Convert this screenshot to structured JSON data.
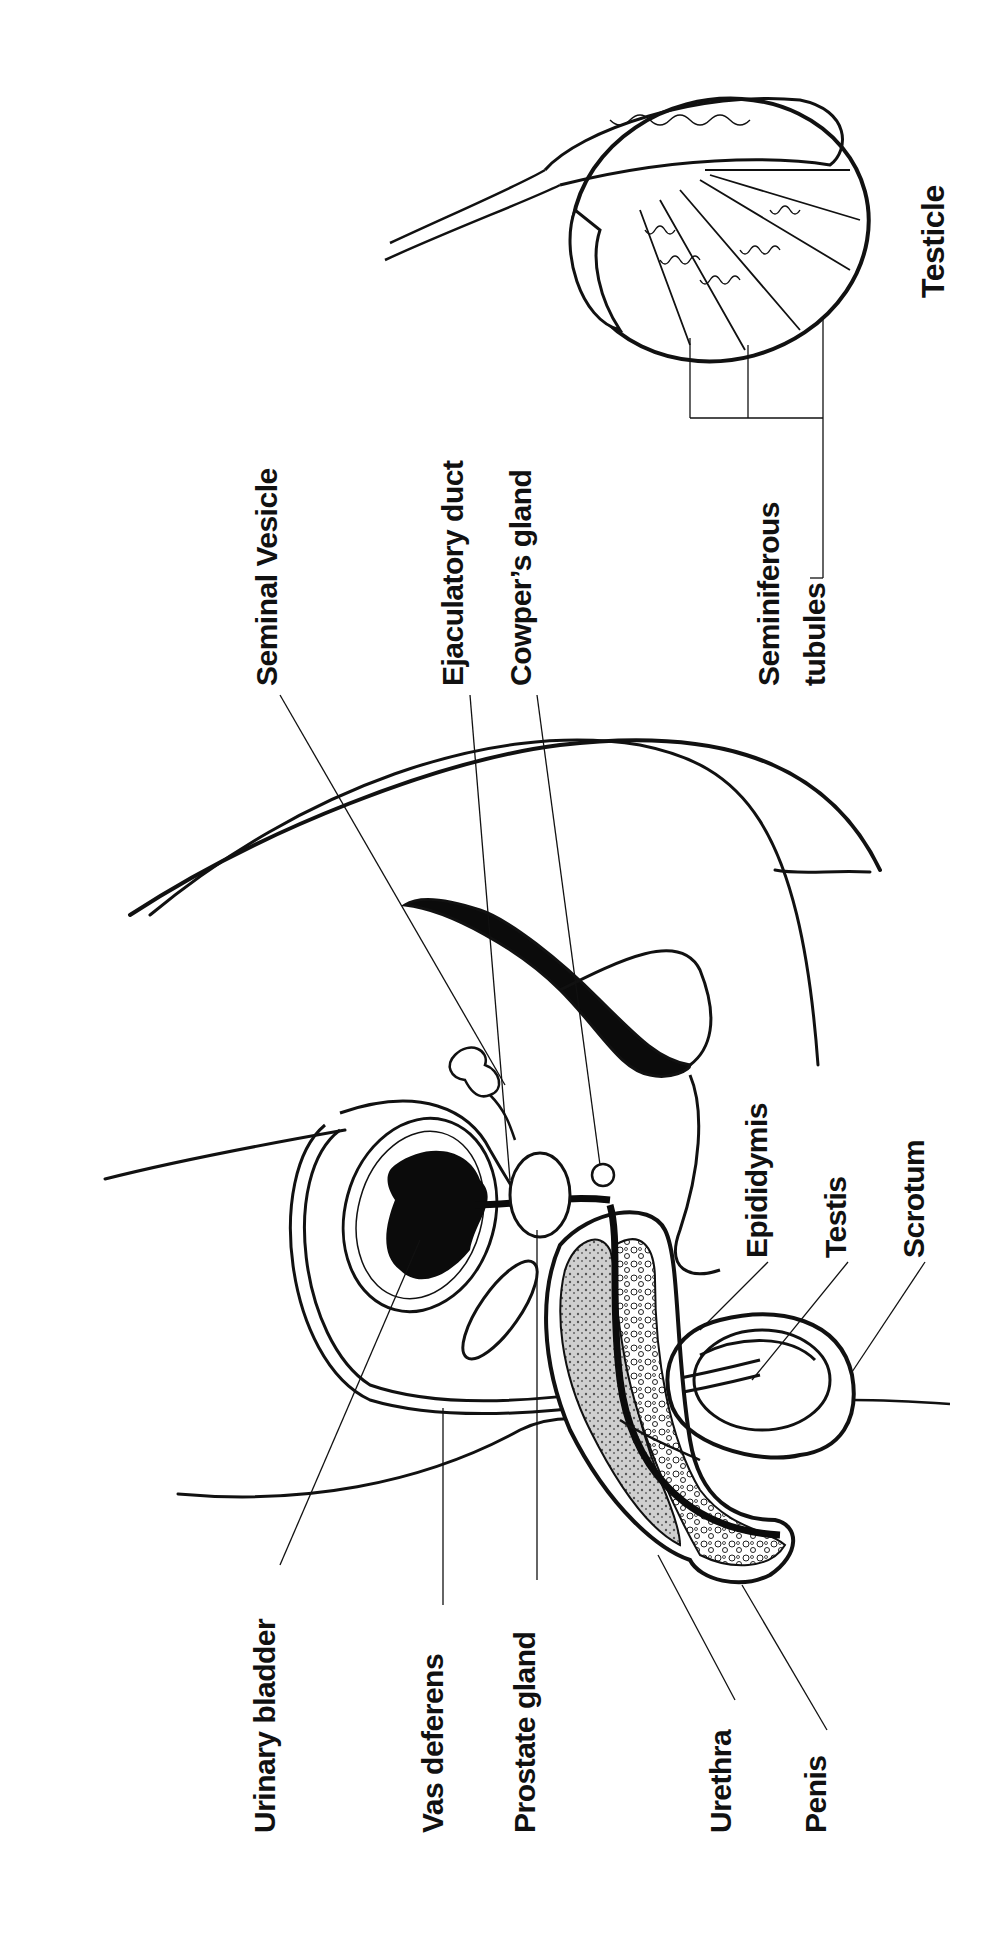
{
  "diagram": {
    "title": "Testicle",
    "orientation": "rotated -90deg",
    "colors": {
      "ink": "#111111",
      "background": "#ffffff",
      "fill_dark": "#0b0b0b",
      "tissue": "#9a9a9a"
    },
    "labels": {
      "urinary_bladder": "Urinary bladder",
      "vas_deferens": "Vas deferens",
      "prostate_gland": "Prostate gland",
      "urethra": "Urethra",
      "penis": "Penis",
      "seminal_vesicle": "Seminal Vesicle",
      "ejaculatory_duct": "Ejaculatory duct",
      "cowpers_gland": "Cowper’s gland",
      "seminiferous": "Seminiferous",
      "tubules": "tubules",
      "testicle": "Testicle",
      "epididymis": "Epididymis",
      "testis": "Testis",
      "scrotum": "Scrotum"
    }
  }
}
